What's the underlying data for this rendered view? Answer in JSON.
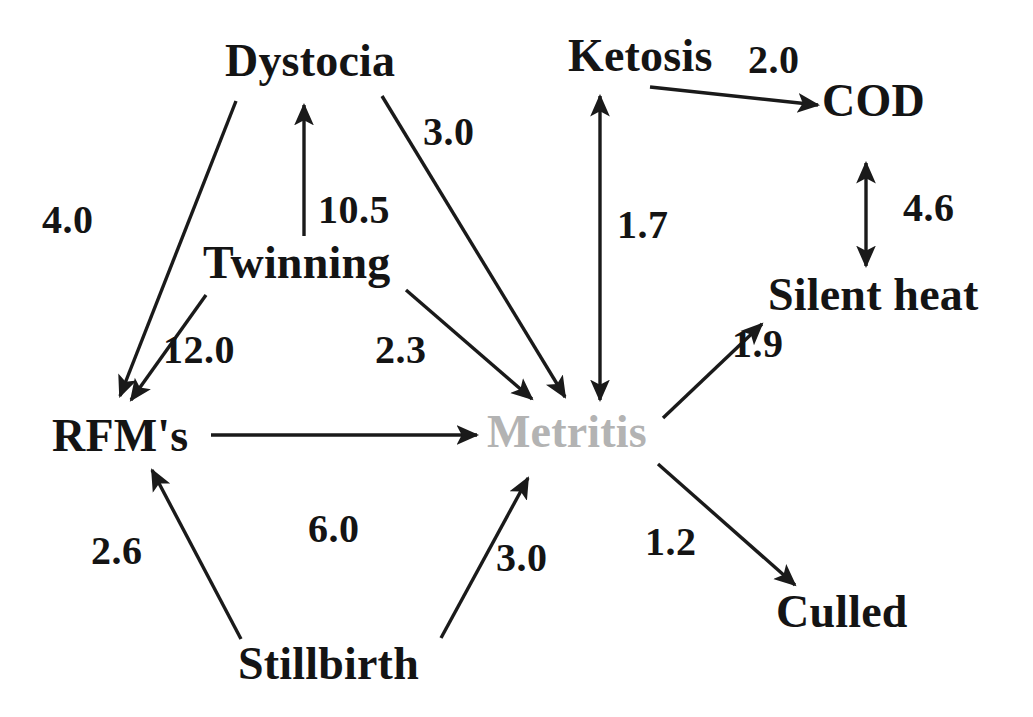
{
  "diagram": {
    "type": "causal-path-diagram",
    "title": "",
    "background_color": "#ffffff",
    "node_color": "#141414",
    "faded_node_color": "#b3b3b3",
    "edge_color": "#1a1a1a",
    "nodes": [
      {
        "id": "dystocia",
        "label": "Dystocia",
        "x": 225,
        "y": 38,
        "font_size": 46,
        "faded": false
      },
      {
        "id": "twinning",
        "label": "Twinning",
        "x": 203,
        "y": 240,
        "font_size": 46,
        "faded": false
      },
      {
        "id": "rfms",
        "label": "RFM's",
        "x": 52,
        "y": 413,
        "font_size": 46,
        "faded": false
      },
      {
        "id": "stillbirth",
        "label": "Stillbirth",
        "x": 238,
        "y": 641,
        "font_size": 46,
        "faded": false
      },
      {
        "id": "metritis",
        "label": "Metritis",
        "x": 487,
        "y": 409,
        "font_size": 46,
        "faded": true
      },
      {
        "id": "ketosis",
        "label": "Ketosis",
        "x": 568,
        "y": 33,
        "font_size": 46,
        "faded": false
      },
      {
        "id": "cod",
        "label": "COD",
        "x": 822,
        "y": 78,
        "font_size": 46,
        "faded": false
      },
      {
        "id": "silent_heat",
        "label": "Silent heat",
        "x": 768,
        "y": 272,
        "font_size": 46,
        "faded": false
      },
      {
        "id": "culled",
        "label": "Culled",
        "x": 776,
        "y": 589,
        "font_size": 46,
        "faded": false
      }
    ],
    "edges": [
      {
        "id": "dystocia-rfms",
        "from": "dystocia",
        "to": "rfms",
        "value": "4.0",
        "label_x": 42,
        "label_y": 200,
        "arrow": "single",
        "x1": 236,
        "y1": 101,
        "x2": 120,
        "y2": 396
      },
      {
        "id": "twinning-dystocia",
        "from": "twinning",
        "to": "dystocia",
        "value": "10.5",
        "label_x": 318,
        "label_y": 190,
        "arrow": "single",
        "x1": 304,
        "y1": 236,
        "x2": 304,
        "y2": 105
      },
      {
        "id": "twinning-rfms",
        "from": "twinning",
        "to": "rfms",
        "value": "12.0",
        "label_x": 163,
        "label_y": 330,
        "arrow": "single",
        "x1": 206,
        "y1": 295,
        "x2": 131,
        "y2": 400
      },
      {
        "id": "dystocia-metritis",
        "from": "dystocia",
        "to": "metritis",
        "value": "3.0",
        "label_x": 423,
        "label_y": 112,
        "arrow": "single",
        "x1": 382,
        "y1": 96,
        "x2": 565,
        "y2": 397
      },
      {
        "id": "twinning-metritis",
        "from": "twinning",
        "to": "metritis",
        "value": "2.3",
        "label_x": 375,
        "label_y": 330,
        "arrow": "single",
        "x1": 406,
        "y1": 290,
        "x2": 532,
        "y2": 399
      },
      {
        "id": "rfms-metritis",
        "from": "rfms",
        "to": "metritis",
        "value": "6.0",
        "label_x": 308,
        "label_y": 509,
        "arrow": "single",
        "x1": 211,
        "y1": 435,
        "x2": 477,
        "y2": 435
      },
      {
        "id": "stillbirth-rfms",
        "from": "stillbirth",
        "to": "rfms",
        "value": "2.6",
        "label_x": 91,
        "label_y": 531,
        "arrow": "single",
        "x1": 241,
        "y1": 639,
        "x2": 152,
        "y2": 470
      },
      {
        "id": "stillbirth-metritis",
        "from": "stillbirth",
        "to": "metritis",
        "value": "3.0",
        "label_x": 496,
        "label_y": 538,
        "arrow": "single",
        "x1": 441,
        "y1": 638,
        "x2": 528,
        "y2": 478
      },
      {
        "id": "ketosis-metritis",
        "from": "ketosis",
        "to": "metritis",
        "value": "1.7",
        "label_x": 617,
        "label_y": 205,
        "arrow": "double",
        "x1": 600,
        "y1": 96,
        "x2": 600,
        "y2": 400
      },
      {
        "id": "ketosis-cod",
        "from": "ketosis",
        "to": "cod",
        "value": "2.0",
        "label_x": 748,
        "label_y": 40,
        "arrow": "single",
        "x1": 650,
        "y1": 87,
        "x2": 818,
        "y2": 105
      },
      {
        "id": "cod-silent-heat",
        "from": "cod",
        "to": "silent_heat",
        "value": "4.6",
        "label_x": 903,
        "label_y": 188,
        "arrow": "double",
        "x1": 866,
        "y1": 163,
        "x2": 866,
        "y2": 266
      },
      {
        "id": "metritis-silent-heat",
        "from": "metritis",
        "to": "silent_heat",
        "value": "1.9",
        "label_x": 732,
        "label_y": 324,
        "arrow": "single",
        "x1": 663,
        "y1": 418,
        "x2": 762,
        "y2": 324
      },
      {
        "id": "metritis-culled",
        "from": "metritis",
        "to": "culled",
        "value": "1.2",
        "label_x": 645,
        "label_y": 522,
        "arrow": "single",
        "x1": 658,
        "y1": 464,
        "x2": 795,
        "y2": 585
      }
    ]
  }
}
